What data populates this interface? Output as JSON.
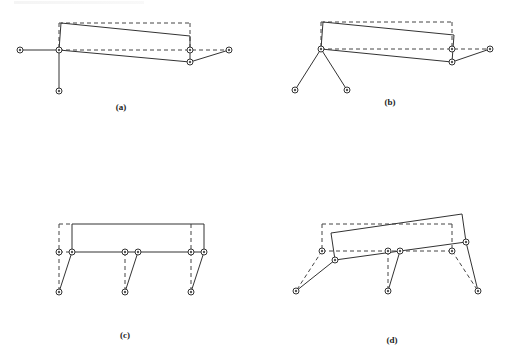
{
  "figure": {
    "panels": [
      {
        "id": "a",
        "label": "(a)",
        "label_pos": [
          121,
          108
        ],
        "solid_lines": [
          [
            [
              20,
              50
            ],
            [
              59,
              50
            ]
          ],
          [
            [
              59,
              50
            ],
            [
              59,
              91
            ]
          ],
          [
            [
              61,
              23
            ],
            [
              59,
              50
            ]
          ],
          [
            [
              61,
              23
            ],
            [
              190,
              36
            ]
          ],
          [
            [
              190,
              36
            ],
            [
              190,
              62
            ]
          ],
          [
            [
              59,
              50
            ],
            [
              190,
              62
            ]
          ],
          [
            [
              190,
              62
            ],
            [
              229,
              50
            ]
          ]
        ],
        "dashed_lines": [
          [
            [
              59,
              23
            ],
            [
              190,
              23
            ]
          ],
          [
            [
              190,
              23
            ],
            [
              190,
              50
            ]
          ],
          [
            [
              59,
              23
            ],
            [
              59,
              50
            ]
          ],
          [
            [
              59,
              50
            ],
            [
              229,
              50
            ]
          ]
        ],
        "nodes": [
          [
            20,
            50
          ],
          [
            59,
            50
          ],
          [
            59,
            91
          ],
          [
            190,
            62
          ],
          [
            229,
            50
          ],
          [
            190,
            50
          ]
        ]
      },
      {
        "id": "b",
        "label": "(b)",
        "label_pos": [
          390,
          103
        ],
        "solid_lines": [
          [
            [
              321,
              49
            ],
            [
              295,
              90
            ]
          ],
          [
            [
              321,
              49
            ],
            [
              347,
              90
            ]
          ],
          [
            [
              323,
              22
            ],
            [
              321,
              49
            ]
          ],
          [
            [
              323,
              22
            ],
            [
              454,
              35
            ]
          ],
          [
            [
              454,
              35
            ],
            [
              452,
              62
            ]
          ],
          [
            [
              321,
              49
            ],
            [
              452,
              62
            ]
          ],
          [
            [
              452,
              62
            ],
            [
              490,
              49
            ]
          ]
        ],
        "dashed_lines": [
          [
            [
              321,
              22
            ],
            [
              452,
              22
            ]
          ],
          [
            [
              452,
              22
            ],
            [
              452,
              49
            ]
          ],
          [
            [
              321,
              22
            ],
            [
              321,
              49
            ]
          ],
          [
            [
              321,
              49
            ],
            [
              490,
              49
            ]
          ]
        ],
        "nodes": [
          [
            321,
            49
          ],
          [
            295,
            90
          ],
          [
            347,
            90
          ],
          [
            452,
            62
          ],
          [
            490,
            49
          ],
          [
            452,
            49
          ]
        ]
      },
      {
        "id": "c",
        "label": "(c)",
        "label_pos": [
          125,
          336
        ],
        "solid_lines": [
          [
            [
              72,
              224
            ],
            [
              204,
              224
            ]
          ],
          [
            [
              72,
              224
            ],
            [
              72,
              252
            ]
          ],
          [
            [
              204,
              224
            ],
            [
              204,
              252
            ]
          ],
          [
            [
              72,
              252
            ],
            [
              204,
              252
            ]
          ],
          [
            [
              72,
              252
            ],
            [
              59,
              292
            ]
          ],
          [
            [
              138,
              252
            ],
            [
              125,
              292
            ]
          ],
          [
            [
              204,
              252
            ],
            [
              191,
              292
            ]
          ]
        ],
        "dashed_lines": [
          [
            [
              59,
              224
            ],
            [
              72,
              224
            ]
          ],
          [
            [
              59,
              224
            ],
            [
              59,
              292
            ]
          ],
          [
            [
              125,
              252
            ],
            [
              125,
              292
            ]
          ],
          [
            [
              191,
              224
            ],
            [
              191,
              292
            ]
          ],
          [
            [
              59,
              252
            ],
            [
              72,
              252
            ]
          ]
        ],
        "nodes": [
          [
            72,
            252
          ],
          [
            138,
            252
          ],
          [
            204,
            252
          ],
          [
            59,
            292
          ],
          [
            125,
            292
          ],
          [
            191,
            292
          ],
          [
            59,
            252
          ],
          [
            125,
            252
          ],
          [
            191,
            252
          ]
        ]
      },
      {
        "id": "d",
        "label": "(d)",
        "label_pos": [
          392,
          341
        ],
        "solid_lines": [
          [
            [
              331,
              233
            ],
            [
              462,
              214
            ]
          ],
          [
            [
              331,
              233
            ],
            [
              335,
              260
            ]
          ],
          [
            [
              462,
              214
            ],
            [
              466,
              242
            ]
          ],
          [
            [
              335,
              260
            ],
            [
              400,
              251
            ]
          ],
          [
            [
              400,
              251
            ],
            [
              466,
              242
            ]
          ],
          [
            [
              335,
              260
            ],
            [
              296,
              291
            ]
          ],
          [
            [
              400,
              251
            ],
            [
              388,
              291
            ]
          ],
          [
            [
              466,
              242
            ],
            [
              478,
              291
            ]
          ]
        ],
        "dashed_lines": [
          [
            [
              322,
              224
            ],
            [
              452,
              224
            ]
          ],
          [
            [
              322,
              224
            ],
            [
              322,
              251
            ]
          ],
          [
            [
              452,
              224
            ],
            [
              452,
              251
            ]
          ],
          [
            [
              322,
              251
            ],
            [
              452,
              251
            ]
          ],
          [
            [
              322,
              251
            ],
            [
              296,
              291
            ]
          ],
          [
            [
              388,
              251
            ],
            [
              388,
              291
            ]
          ],
          [
            [
              452,
              251
            ],
            [
              478,
              291
            ]
          ]
        ],
        "nodes": [
          [
            335,
            260
          ],
          [
            400,
            251
          ],
          [
            466,
            242
          ],
          [
            296,
            291
          ],
          [
            388,
            291
          ],
          [
            478,
            291
          ],
          [
            322,
            251
          ],
          [
            388,
            251
          ],
          [
            452,
            251
          ]
        ]
      }
    ]
  }
}
